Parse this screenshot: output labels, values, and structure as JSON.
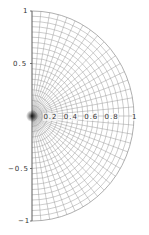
{
  "chart_data": {
    "type": "polar-grid",
    "title": "",
    "xlabel": "",
    "ylabel": "",
    "theta_range_deg": [
      -90,
      90
    ],
    "r_range": [
      0,
      1
    ],
    "spoke_step_deg": 5,
    "ring_step": 0.05,
    "x_ticks": [
      "0.2",
      "0.4",
      "0.6",
      "0.8",
      "1"
    ],
    "x_tick_values": [
      0.2,
      0.4,
      0.6,
      0.8,
      1.0
    ],
    "y_ticks": [
      "1",
      "0.5",
      "−0.5",
      "−1"
    ],
    "y_tick_values": [
      1,
      0.5,
      -0.5,
      -1
    ],
    "grid": true,
    "legend": null,
    "series": []
  },
  "layout": {
    "center_x": 32,
    "center_y": 116,
    "radius_x": 102,
    "radius_y": 105,
    "grid_color": "#9a9a9a",
    "axis_color": "#555555",
    "center_shade_color": "#000000"
  }
}
